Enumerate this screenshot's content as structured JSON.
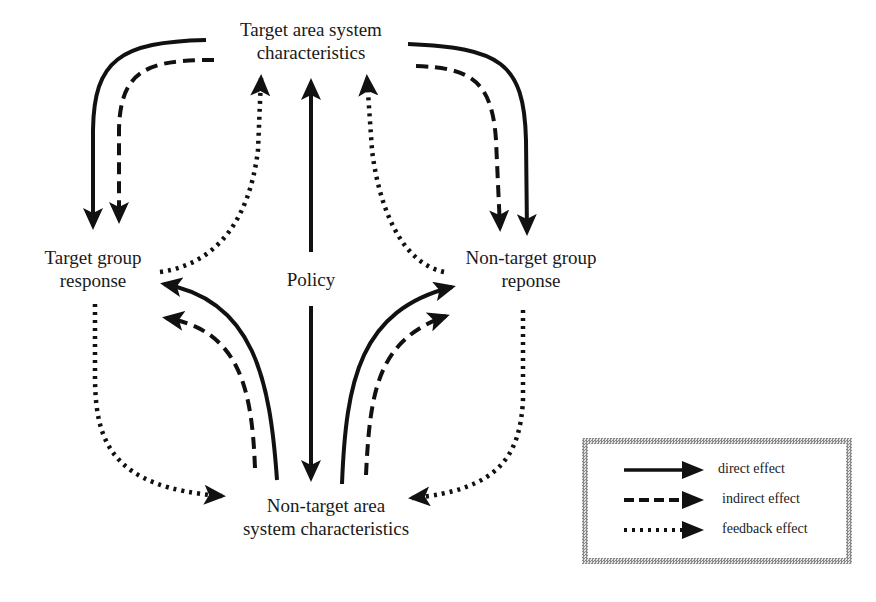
{
  "diagram": {
    "type": "flow",
    "nodes": {
      "target_area": {
        "line1": "Target area system",
        "line2": "characteristics"
      },
      "target_group": {
        "line1": "Target group",
        "line2": "response"
      },
      "policy": {
        "label": "Policy"
      },
      "nontarget_group": {
        "line1": "Non-target group",
        "line2": "reponse"
      },
      "nontarget_area": {
        "line1": "Non-target area",
        "line2": "system characteristics"
      }
    },
    "edges": [
      {
        "from": "Policy",
        "to": "Target area system characteristics",
        "style": "direct"
      },
      {
        "from": "Policy",
        "to": "Non-target area system characteristics",
        "style": "direct"
      },
      {
        "from": "Target area system characteristics",
        "to": "Target group response",
        "style": "direct"
      },
      {
        "from": "Target area system characteristics",
        "to": "Target group response",
        "style": "indirect"
      },
      {
        "from": "Target area system characteristics",
        "to": "Non-target group reponse",
        "style": "direct"
      },
      {
        "from": "Target area system characteristics",
        "to": "Non-target group reponse",
        "style": "indirect"
      },
      {
        "from": "Target group response",
        "to": "Target area system characteristics",
        "style": "feedback"
      },
      {
        "from": "Non-target group reponse",
        "to": "Target area system characteristics",
        "style": "feedback"
      },
      {
        "from": "Non-target area system characteristics",
        "to": "Target group response",
        "style": "direct"
      },
      {
        "from": "Non-target area system characteristics",
        "to": "Target group response",
        "style": "indirect"
      },
      {
        "from": "Non-target area system characteristics",
        "to": "Non-target group reponse",
        "style": "direct"
      },
      {
        "from": "Non-target area system characteristics",
        "to": "Non-target group reponse",
        "style": "indirect"
      },
      {
        "from": "Target group response",
        "to": "Non-target area system characteristics",
        "style": "feedback"
      },
      {
        "from": "Non-target group reponse",
        "to": "Non-target area system characteristics",
        "style": "feedback"
      }
    ]
  },
  "legend": {
    "items": [
      {
        "style": "solid",
        "label": "direct effect"
      },
      {
        "style": "dashed",
        "label": "indirect effect"
      },
      {
        "style": "dotted",
        "label": "feedback effect"
      }
    ]
  },
  "colors": {
    "ink": "#111111",
    "background": "#ffffff",
    "legend_border": "#8a8a8a"
  }
}
